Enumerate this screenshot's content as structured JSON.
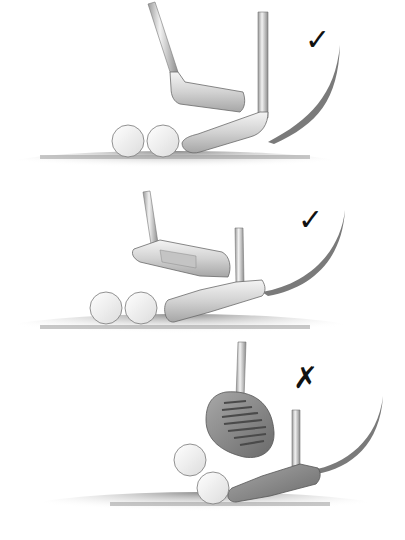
{
  "illustration": {
    "subject": "Three putter styles aligned behind golf balls",
    "panels": [
      {
        "id": "blade-putter",
        "club": "blade putter",
        "balls": 2,
        "mark": "✓",
        "verdict": "correct"
      },
      {
        "id": "heel-toe-putter",
        "club": "heel-toe weighted putter",
        "balls": 2,
        "mark": "✓",
        "verdict": "correct"
      },
      {
        "id": "mallet-putter",
        "club": "mallet putter",
        "balls": 2,
        "mark": "✗",
        "verdict": "incorrect"
      }
    ]
  },
  "colors": {
    "background": "#ffffff",
    "metal_light": "#eeeeee",
    "metal_mid": "#bdbdbd",
    "metal_dark": "#6e6e6e",
    "arc_shadow": "#7a7a7a",
    "grass": "#8c8c8c",
    "mark": "#111111"
  }
}
